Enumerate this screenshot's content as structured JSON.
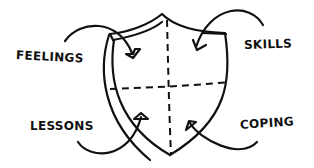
{
  "diagram": {
    "type": "hand-drawn shield split into four quadrants",
    "labels": {
      "top_left": "FEELINGS",
      "top_right": "SKILLS",
      "bottom_left": "LESSONS",
      "bottom_right": "COPING"
    },
    "stroke_color": "#111111",
    "background": "#ffffff"
  }
}
